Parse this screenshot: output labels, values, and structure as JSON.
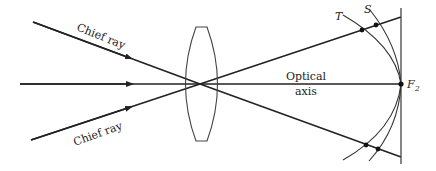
{
  "diagram": {
    "labels": {
      "chief_ray_upper": "Chief ray",
      "chief_ray_lower": "Chief ray",
      "optical_axis_line1": "Optical",
      "optical_axis_line2": "axis",
      "tangential": "T",
      "sagittal": "S",
      "focal_point": "F",
      "focal_point_sub": "2"
    },
    "colors": {
      "line": "#222222",
      "background": "#ffffff"
    }
  }
}
